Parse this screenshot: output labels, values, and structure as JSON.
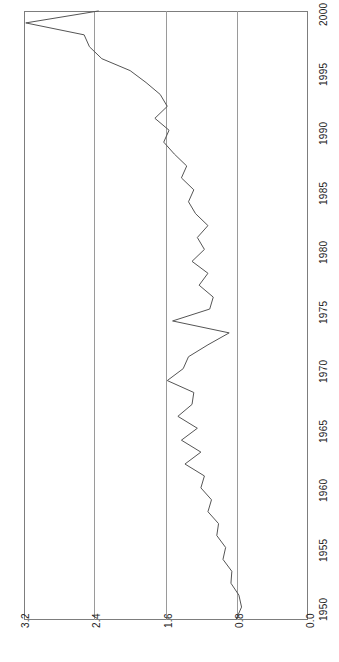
{
  "chart_data": {
    "type": "line",
    "title": "",
    "xlabel": "",
    "ylabel": "",
    "orientation": "rotated-90",
    "grid": true,
    "legend": "none",
    "value_axis": {
      "name": "value",
      "ticks": [
        "3.2",
        "2.4",
        "1.6",
        "0.8",
        "0.0"
      ],
      "tick_values": [
        3.2,
        2.4,
        1.6,
        0.8,
        0.0
      ],
      "limits": [
        3.2,
        0.0
      ],
      "direction": "decreasing-left-to-right"
    },
    "time_axis": {
      "name": "year",
      "ticks": [
        "1950",
        "1955",
        "1960",
        "1965",
        "1970",
        "1975",
        "1980",
        "1985",
        "1990",
        "1995",
        "2000"
      ],
      "tick_values": [
        1950,
        1955,
        1960,
        1965,
        1970,
        1975,
        1980,
        1985,
        1990,
        1995,
        2000
      ],
      "limits": [
        1950,
        2001
      ],
      "direction": "increasing-bottom-to-top"
    },
    "series": [
      {
        "name": "value",
        "color": "#555555",
        "x": [
          1950,
          1951,
          1952,
          1953,
          1954,
          1955,
          1956,
          1957,
          1958,
          1959,
          1960,
          1961,
          1962,
          1963,
          1964,
          1965,
          1966,
          1967,
          1968,
          1969,
          1970,
          1971,
          1972,
          1973,
          1974,
          1975,
          1976,
          1977,
          1978,
          1979,
          1980,
          1981,
          1982,
          1983,
          1984,
          1985,
          1986,
          1987,
          1988,
          1989,
          1990,
          1991,
          1992,
          1993,
          1994,
          1995,
          1996,
          1997,
          1998,
          1999,
          2000,
          2001
        ],
        "y": [
          0.8,
          0.74,
          0.77,
          0.86,
          0.85,
          0.95,
          0.92,
          1.02,
          1.0,
          1.12,
          1.08,
          1.2,
          1.16,
          1.38,
          1.2,
          1.42,
          1.24,
          1.46,
          1.3,
          1.28,
          1.58,
          1.4,
          1.34,
          1.12,
          0.88,
          1.52,
          1.1,
          1.06,
          1.22,
          1.12,
          1.3,
          1.16,
          1.24,
          1.12,
          1.26,
          1.34,
          1.28,
          1.42,
          1.36,
          1.5,
          1.62,
          1.56,
          1.72,
          1.58,
          1.66,
          1.82,
          2.0,
          2.32,
          2.46,
          2.52,
          3.18,
          2.36
        ]
      }
    ]
  }
}
